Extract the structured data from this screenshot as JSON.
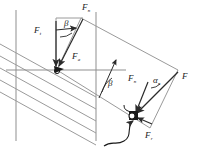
{
  "figure": {
    "type": "engineering-force-diagram",
    "background": "#ffffff",
    "line_color_structure": "#8a8a8a",
    "line_color_vector": "#2b2b2b",
    "text_color": "#1a1a1a"
  },
  "labels": {
    "force_normal_top": {
      "base": "F",
      "sub": "n",
      "x": 84,
      "y": 6
    },
    "force_tangential": {
      "base": "F",
      "sub": "t",
      "x": 36,
      "y": 30
    },
    "force_axial": {
      "base": "F",
      "sub": "a",
      "x": 75,
      "y": 56
    },
    "force_normal_right": {
      "base": "F",
      "sub": "n",
      "x": 131,
      "y": 78
    },
    "force_resultant": {
      "base": "F",
      "sub": "",
      "x": 184,
      "y": 77
    },
    "force_radial": {
      "base": "F",
      "sub": "r",
      "x": 147,
      "y": 134
    },
    "angle_beta_top": {
      "text": "β",
      "x": 66,
      "y": 24
    },
    "angle_beta_mid": {
      "text": "β",
      "x": 110,
      "y": 84
    },
    "angle_alpha_n": {
      "base": "α",
      "sub": "n",
      "x": 155,
      "y": 79
    }
  },
  "geometry": {
    "axis_horizontal": {
      "x1": 8,
      "y1": 70,
      "x2": 126,
      "y2": 70
    },
    "vertical_left": {
      "x1": 16,
      "y1": 10,
      "x2": 16,
      "y2": 140
    },
    "vertical_right": {
      "x1": 96,
      "y1": 12,
      "x2": 96,
      "y2": 140
    },
    "helix_lines_count": 4,
    "tooth_face_corners": [
      [
        81,
        18
      ],
      [
        178,
        68
      ],
      [
        150,
        128
      ],
      [
        62,
        105
      ]
    ],
    "vector_Ft": {
      "x1": 56,
      "y1": 22,
      "x2": 56,
      "y2": 68
    },
    "vector_Fn_top": {
      "x1": 56,
      "y1": 22,
      "x2": 83,
      "y2": 18
    },
    "vector_Fa": {
      "x1": 83,
      "y1": 18,
      "x2": 57,
      "y2": 69
    },
    "vector_F": {
      "x1": 178,
      "y1": 72,
      "x2": 133,
      "y2": 117
    },
    "vector_Fn_right": {
      "x1": 148,
      "y1": 80,
      "x2": 133,
      "y2": 117
    },
    "vector_Fr": {
      "x1": 150,
      "y1": 125,
      "x2": 133,
      "y2": 117
    }
  },
  "annotations": {
    "contact_point_left": {
      "x": 57,
      "y": 69,
      "shape": "filled-arrowhead"
    },
    "contact_point_right": {
      "x": 133,
      "y": 117,
      "shape": "filled-square-node"
    },
    "leader_curve": "curved-pointer-from-below"
  }
}
